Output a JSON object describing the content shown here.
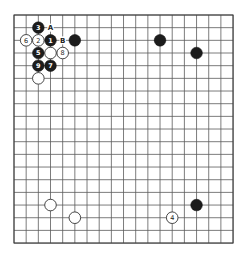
{
  "board": {
    "size": 19,
    "origin": {
      "x": 14,
      "y": 15
    },
    "spacing": {
      "x": 12.17,
      "y": 12.67
    },
    "background": "#ffffff",
    "line_color": "#5a5a5a",
    "stone_radius": 5.8
  },
  "stones": [
    {
      "color": "black",
      "col": 3,
      "row": 2,
      "label": "1"
    },
    {
      "color": "white",
      "col": 2,
      "row": 2,
      "label": "2"
    },
    {
      "color": "black",
      "col": 2,
      "row": 1,
      "label": "3"
    },
    {
      "color": "white",
      "col": 13,
      "row": 16,
      "label": "4"
    },
    {
      "color": "black",
      "col": 2,
      "row": 3,
      "label": "5"
    },
    {
      "color": "white",
      "col": 1,
      "row": 2,
      "label": "6"
    },
    {
      "color": "black",
      "col": 3,
      "row": 4,
      "label": "7"
    },
    {
      "color": "white",
      "col": 4,
      "row": 3,
      "label": "8"
    },
    {
      "color": "black",
      "col": 2,
      "row": 4,
      "label": "9"
    },
    {
      "color": "black",
      "col": 5,
      "row": 2,
      "label": ""
    },
    {
      "color": "white",
      "col": 3,
      "row": 3,
      "label": ""
    },
    {
      "color": "white",
      "col": 2,
      "row": 5,
      "label": ""
    },
    {
      "color": "black",
      "col": 12,
      "row": 2,
      "label": ""
    },
    {
      "color": "black",
      "col": 15,
      "row": 3,
      "label": ""
    },
    {
      "color": "black",
      "col": 15,
      "row": 15,
      "label": ""
    },
    {
      "color": "white",
      "col": 3,
      "row": 15,
      "label": ""
    },
    {
      "color": "white",
      "col": 5,
      "row": 16,
      "label": ""
    }
  ],
  "marks": [
    {
      "col": 3,
      "row": 1,
      "label": "A"
    },
    {
      "col": 4,
      "row": 2,
      "label": "B"
    }
  ]
}
